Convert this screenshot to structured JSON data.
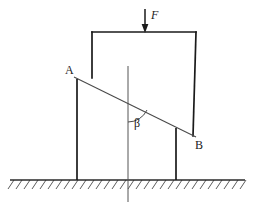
{
  "figure": {
    "background_color": "#ffffff",
    "stroke_color": "#1a1a1a",
    "thin_stroke_color": "#3c3c3c",
    "width": 255,
    "height": 218
  },
  "labels": {
    "point_a": "A",
    "point_b": "B",
    "force": "F",
    "angle": "β"
  },
  "geometry": {
    "block": {
      "top_left": [
        92,
        32
      ],
      "top_right": [
        196,
        32
      ],
      "left_bottom": [
        92,
        78
      ],
      "right_bottom": [
        193,
        136
      ]
    },
    "incline_line": {
      "from": [
        74,
        77
      ],
      "to": [
        196,
        137
      ]
    },
    "left_leg": {
      "x": 77,
      "y_top": 79,
      "y_bottom": 180
    },
    "right_leg": {
      "x": 176,
      "y_top": 128,
      "y_bottom": 180
    },
    "vertical_reference": {
      "x": 128,
      "y_top": 66,
      "y_bottom": 202
    },
    "ground_line": {
      "x_start": 10,
      "x_end": 245,
      "y": 180
    },
    "hatch": {
      "count": 30,
      "spacing": 8,
      "dx": -6,
      "dy": 9
    },
    "force_arrow": {
      "x": 145,
      "y_top": 9,
      "y_bottom": 32
    },
    "angle_arc": {
      "center": [
        128,
        101
      ],
      "radius": 21,
      "start_angle_deg": 90,
      "end_angle_deg": 26
    }
  }
}
